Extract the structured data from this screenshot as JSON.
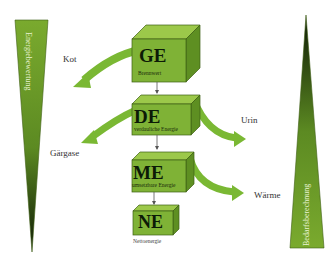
{
  "diagram": {
    "left_bar": {
      "label": "Energiebewertung",
      "direction": "wide-top-to-tip-bottom"
    },
    "right_bar": {
      "label": "Bedarfsberechnung",
      "direction": "tip-top-to-wide-bottom"
    },
    "levels": [
      {
        "abbr": "GE",
        "name": "Bruttoenergie",
        "sub_visible": "Brennwert"
      },
      {
        "abbr": "DE",
        "name": "verdauliche Energie"
      },
      {
        "abbr": "ME",
        "name": "umsetzbare Energie"
      },
      {
        "abbr": "NE",
        "name": "Nettoenergie"
      }
    ],
    "losses": [
      {
        "label": "Kot",
        "from": "GE",
        "side": "left"
      },
      {
        "label": "Gärgase",
        "from": "DE",
        "side": "left"
      },
      {
        "label": "Urin",
        "from": "DE",
        "side": "right"
      },
      {
        "label": "Wärme",
        "from": "ME",
        "side": "right"
      }
    ],
    "colors": {
      "box_front": "#7fb236",
      "box_top": "#9cc84a",
      "box_side": "#5e8f22",
      "arrow": "#7ab833",
      "triangle_light": "#7aaa2e",
      "triangle_dark": "#0e1a05"
    }
  }
}
